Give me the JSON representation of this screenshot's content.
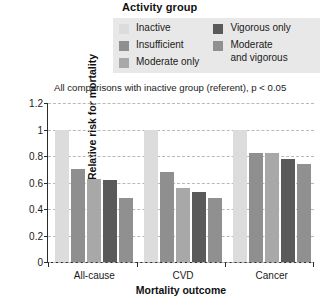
{
  "legend": {
    "title": "Activity group",
    "background": "#e8e8e8",
    "columns": [
      {
        "entries": [
          {
            "label": "Inactive",
            "color": "#dcdcdc"
          },
          {
            "label": "Insufficient",
            "color": "#8f8f8f"
          },
          {
            "label": "Moderate only",
            "color": "#a8a8a8"
          }
        ]
      },
      {
        "entries": [
          {
            "label": "Vigorous only",
            "color": "#5a5a5a"
          },
          {
            "label": "Moderate\nand vigorous",
            "color": "#909090"
          }
        ]
      }
    ]
  },
  "annotation": "All comparisons with inactive group (referent), p < 0.05",
  "chart_data": {
    "type": "bar",
    "title": "",
    "xlabel": "Mortality outcome",
    "ylabel": "Relative risk for mortality",
    "categories": [
      "All-cause",
      "CVD",
      "Cancer"
    ],
    "ylim": [
      0,
      1.2
    ],
    "yticks": [
      0,
      0.2,
      0.4,
      0.6,
      0.8,
      1,
      1.2
    ],
    "ytick_labels": [
      "0",
      "0.2",
      "0.4",
      "0.6",
      "0.8",
      "1",
      "1.2"
    ],
    "grid": true,
    "legend_position": "top",
    "series": [
      {
        "name": "Inactive",
        "color": "#dcdcdc",
        "values": [
          1.0,
          1.0,
          1.0
        ]
      },
      {
        "name": "Insufficient",
        "color": "#8f8f8f",
        "values": [
          0.7,
          0.68,
          0.82
        ]
      },
      {
        "name": "Moderate only",
        "color": "#a8a8a8",
        "values": [
          0.63,
          0.56,
          0.82
        ]
      },
      {
        "name": "Vigorous only",
        "color": "#5a5a5a",
        "values": [
          0.62,
          0.53,
          0.78
        ]
      },
      {
        "name": "Moderate and vigorous",
        "color": "#909090",
        "values": [
          0.48,
          0.48,
          0.74
        ]
      }
    ]
  }
}
